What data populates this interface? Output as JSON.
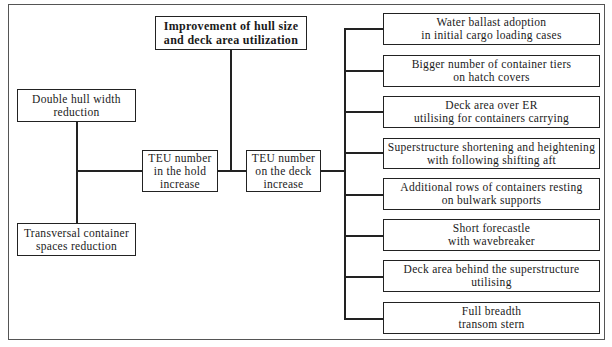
{
  "diagram": {
    "top_goal": {
      "lines": [
        "Improvement of hull size",
        "and deck area utilization"
      ]
    },
    "left_factors": [
      {
        "lines": [
          "Double hull width",
          "reduction"
        ]
      },
      {
        "lines": [
          "Transversal container",
          "spaces reduction"
        ]
      }
    ],
    "hold_increase": {
      "lines": [
        "TEU number",
        "in the hold",
        "increase"
      ]
    },
    "deck_increase": {
      "lines": [
        "TEU number",
        "on the deck",
        "increase"
      ]
    },
    "deck_measures": [
      {
        "lines": [
          "Water ballast adoption",
          "in initial cargo loading cases"
        ]
      },
      {
        "lines": [
          "Bigger number of container tiers",
          "on hatch covers"
        ]
      },
      {
        "lines": [
          "Deck area over ER",
          "utilising for containers carrying"
        ]
      },
      {
        "lines": [
          "Superstructure shortening and heightening",
          "with following shifting aft"
        ]
      },
      {
        "lines": [
          "Additional rows of containers resting",
          "on bulwark supports"
        ]
      },
      {
        "lines": [
          "Short forecastle",
          "with wavebreaker"
        ]
      },
      {
        "lines": [
          "Deck area behind the superstructure",
          "utilising"
        ]
      },
      {
        "lines": [
          "Full breadth",
          "transom stern"
        ]
      }
    ]
  },
  "colors": {
    "line": "#222222",
    "background": "#ffffff"
  }
}
